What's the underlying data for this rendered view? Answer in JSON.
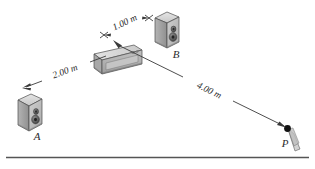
{
  "figure": {
    "kind": "physics-diagram",
    "background_color": "#ffffff",
    "line_color": "#3a3a3a",
    "object_fill_light": "#d9d9d9",
    "object_fill_mid": "#bdbdbd",
    "object_fill_dark": "#9a9a9a",
    "cone_color": "#6e6e6e",
    "dot_color": "#111111",
    "rule_color": "#555555"
  },
  "labels": {
    "speaker_a": "A",
    "speaker_b": "B",
    "point_p": "P",
    "dim_a_to_source": "2.00 m",
    "dim_source_to_b": "1.00 m",
    "dim_source_to_p": "4.00 m"
  },
  "geometry": {
    "speaker_a": {
      "x": 14,
      "y": 95,
      "w": 28,
      "h": 35
    },
    "speaker_b": {
      "x": 152,
      "y": 12,
      "w": 27,
      "h": 36
    },
    "source_unit": {
      "x": 88,
      "y": 45,
      "w": 54,
      "h": 33
    },
    "point_p": {
      "x": 287,
      "y": 128
    },
    "baseline_y": 157
  },
  "measurements": [
    {
      "name": "dim_a_to_source",
      "value": "2.00 m",
      "from": "A",
      "to": "source"
    },
    {
      "name": "dim_source_to_b",
      "value": "1.00 m",
      "from": "source",
      "to": "B"
    },
    {
      "name": "dim_source_to_p",
      "value": "4.00 m",
      "from": "source",
      "to": "P"
    }
  ]
}
